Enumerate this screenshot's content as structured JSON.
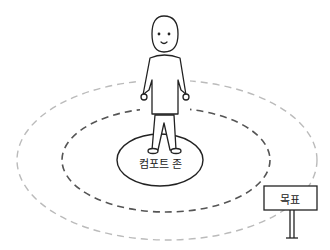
{
  "diagram": {
    "comfort_zone_label": "컴포트 존",
    "goal_sign_label": "목표",
    "zones": [
      {
        "name": "comfort-zone",
        "style": "solid",
        "color": "#222222"
      },
      {
        "name": "learning-zone",
        "style": "dashed",
        "color": "#555555"
      },
      {
        "name": "outer-zone",
        "style": "dashed",
        "color": "#bbbbbb"
      }
    ],
    "figure": "stick-person-smiling"
  }
}
